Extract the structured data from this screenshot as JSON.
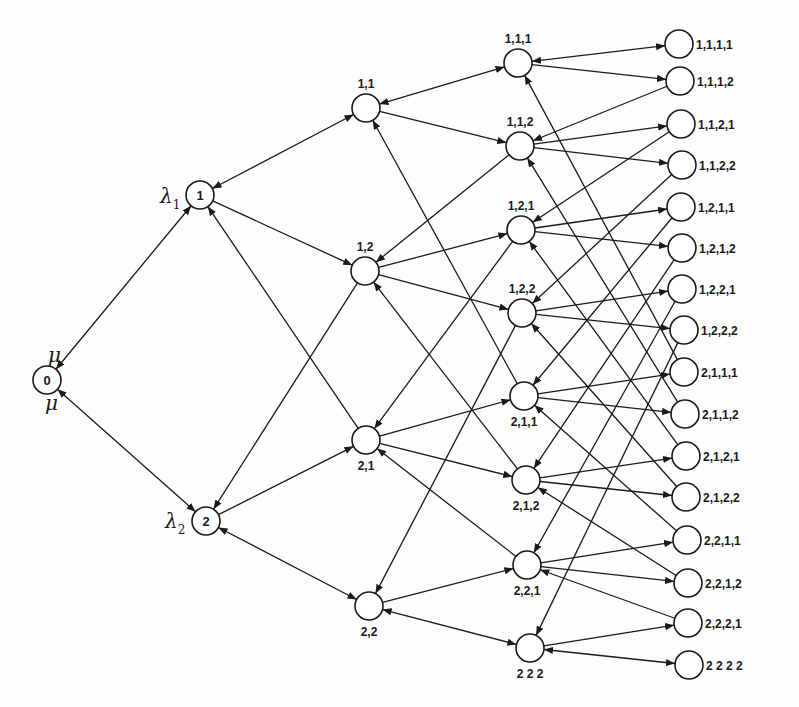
{
  "diagram": {
    "title": "",
    "rate_labels": {
      "lambda1": "λ",
      "lambda1_sub": "1",
      "lambda2": "λ",
      "lambda2_sub": "2",
      "mu_top": "μ",
      "mu_bottom": "μ"
    },
    "node_radius": 14,
    "nodes": [
      {
        "id": "0",
        "label": "0",
        "x": 47,
        "y": 380,
        "label_pos": "inside"
      },
      {
        "id": "1",
        "label": "1",
        "x": 200,
        "y": 195,
        "label_pos": "inside"
      },
      {
        "id": "2",
        "label": "2",
        "x": 206,
        "y": 521,
        "label_pos": "inside"
      },
      {
        "id": "11",
        "label": "1,1",
        "x": 366,
        "y": 108,
        "label_pos": "above"
      },
      {
        "id": "12",
        "label": "1,2",
        "x": 365,
        "y": 271,
        "label_pos": "above"
      },
      {
        "id": "21",
        "label": "2,1",
        "x": 366,
        "y": 440,
        "label_pos": "below"
      },
      {
        "id": "22",
        "label": "2,2",
        "x": 369,
        "y": 606,
        "label_pos": "below"
      },
      {
        "id": "111",
        "label": "1,1,1",
        "x": 518,
        "y": 63,
        "label_pos": "above"
      },
      {
        "id": "112",
        "label": "1,1,2",
        "x": 520,
        "y": 146,
        "label_pos": "above"
      },
      {
        "id": "121",
        "label": "1,2,1",
        "x": 521,
        "y": 230,
        "label_pos": "above"
      },
      {
        "id": "122",
        "label": "1,2,2",
        "x": 522,
        "y": 313,
        "label_pos": "above"
      },
      {
        "id": "211",
        "label": "2,1,1",
        "x": 524,
        "y": 396,
        "label_pos": "below"
      },
      {
        "id": "212",
        "label": "2,1,2",
        "x": 526,
        "y": 480,
        "label_pos": "below"
      },
      {
        "id": "221",
        "label": "2,2,1",
        "x": 527,
        "y": 565,
        "label_pos": "below"
      },
      {
        "id": "222",
        "label": "2 2 2",
        "x": 530,
        "y": 648,
        "label_pos": "below"
      },
      {
        "id": "1111",
        "label": "1,1,1,1",
        "x": 679,
        "y": 44,
        "label_pos": "right"
      },
      {
        "id": "1112",
        "label": "1,1,1,2",
        "x": 680,
        "y": 81,
        "label_pos": "right"
      },
      {
        "id": "1121",
        "label": "1,1,2,1",
        "x": 681,
        "y": 124,
        "label_pos": "right"
      },
      {
        "id": "1122",
        "label": "1,1,2,2",
        "x": 682,
        "y": 165,
        "label_pos": "right"
      },
      {
        "id": "1211",
        "label": "1,2,1,1",
        "x": 681,
        "y": 207,
        "label_pos": "right"
      },
      {
        "id": "1212",
        "label": "1,2,1,2",
        "x": 682,
        "y": 248,
        "label_pos": "right"
      },
      {
        "id": "1221",
        "label": "1,2,2,1",
        "x": 682,
        "y": 289,
        "label_pos": "right"
      },
      {
        "id": "1222",
        "label": "1,2,2,2",
        "x": 684,
        "y": 330,
        "label_pos": "right"
      },
      {
        "id": "2111",
        "label": "2,1,1,1",
        "x": 684,
        "y": 372,
        "label_pos": "right"
      },
      {
        "id": "2112",
        "label": "2,1,1,2",
        "x": 685,
        "y": 414,
        "label_pos": "right"
      },
      {
        "id": "2121",
        "label": "2,1,2,1",
        "x": 686,
        "y": 456,
        "label_pos": "right"
      },
      {
        "id": "2122",
        "label": "2,1,2,2",
        "x": 686,
        "y": 497,
        "label_pos": "right"
      },
      {
        "id": "2211",
        "label": "2,2,1,1",
        "x": 687,
        "y": 540,
        "label_pos": "right"
      },
      {
        "id": "2212",
        "label": "2,2,1,2",
        "x": 688,
        "y": 583,
        "label_pos": "right"
      },
      {
        "id": "2221",
        "label": "2,2,2,1",
        "x": 688,
        "y": 623,
        "label_pos": "right"
      },
      {
        "id": "2222",
        "label": "2 2 2 2",
        "x": 689,
        "y": 665,
        "label_pos": "right"
      }
    ]
  }
}
